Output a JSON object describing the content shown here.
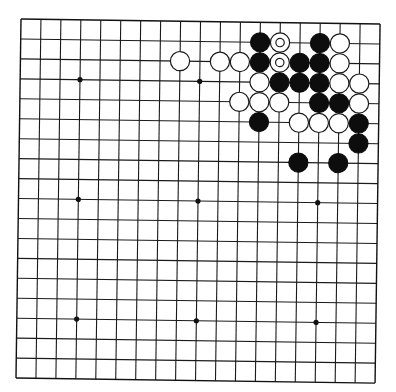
{
  "board": {
    "size": 19,
    "origin": {
      "x": 21,
      "y": 19
    },
    "spacing": 19.95,
    "rotation_deg": 0.8,
    "stone_radius": 9.6,
    "colors": {
      "line": "#1a1a1a",
      "black_stone": "#0d0d0d",
      "white_stone": "#ffffff",
      "background": "#ffffff"
    },
    "star_points": [
      [
        3,
        3
      ],
      [
        9,
        3
      ],
      [
        15,
        3
      ],
      [
        3,
        9
      ],
      [
        9,
        9
      ],
      [
        15,
        9
      ],
      [
        3,
        15
      ],
      [
        9,
        15
      ],
      [
        15,
        15
      ]
    ],
    "stones": [
      {
        "col": 12,
        "row": 1,
        "color": "black"
      },
      {
        "col": 13,
        "row": 1,
        "color": "white",
        "marked": true
      },
      {
        "col": 15,
        "row": 1,
        "color": "black"
      },
      {
        "col": 16,
        "row": 1,
        "color": "white"
      },
      {
        "col": 8,
        "row": 2,
        "color": "white"
      },
      {
        "col": 10,
        "row": 2,
        "color": "white"
      },
      {
        "col": 11,
        "row": 2,
        "color": "white"
      },
      {
        "col": 12,
        "row": 2,
        "color": "black"
      },
      {
        "col": 13,
        "row": 2,
        "color": "white",
        "marked": true
      },
      {
        "col": 14,
        "row": 2,
        "color": "black"
      },
      {
        "col": 15,
        "row": 2,
        "color": "black"
      },
      {
        "col": 16,
        "row": 2,
        "color": "white"
      },
      {
        "col": 12,
        "row": 3,
        "color": "white"
      },
      {
        "col": 13,
        "row": 3,
        "color": "black"
      },
      {
        "col": 14,
        "row": 3,
        "color": "black"
      },
      {
        "col": 15,
        "row": 3,
        "color": "black"
      },
      {
        "col": 16,
        "row": 3,
        "color": "white"
      },
      {
        "col": 17,
        "row": 3,
        "color": "white"
      },
      {
        "col": 11,
        "row": 4,
        "color": "white"
      },
      {
        "col": 12,
        "row": 4,
        "color": "white"
      },
      {
        "col": 13,
        "row": 4,
        "color": "white"
      },
      {
        "col": 15,
        "row": 4,
        "color": "black"
      },
      {
        "col": 16,
        "row": 4,
        "color": "black"
      },
      {
        "col": 17,
        "row": 4,
        "color": "white"
      },
      {
        "col": 12,
        "row": 5,
        "color": "black"
      },
      {
        "col": 14,
        "row": 5,
        "color": "white"
      },
      {
        "col": 15,
        "row": 5,
        "color": "white"
      },
      {
        "col": 16,
        "row": 5,
        "color": "white"
      },
      {
        "col": 17,
        "row": 5,
        "color": "black"
      },
      {
        "col": 17,
        "row": 6,
        "color": "black"
      },
      {
        "col": 14,
        "row": 7,
        "color": "black"
      },
      {
        "col": 16,
        "row": 7,
        "color": "black"
      }
    ]
  }
}
